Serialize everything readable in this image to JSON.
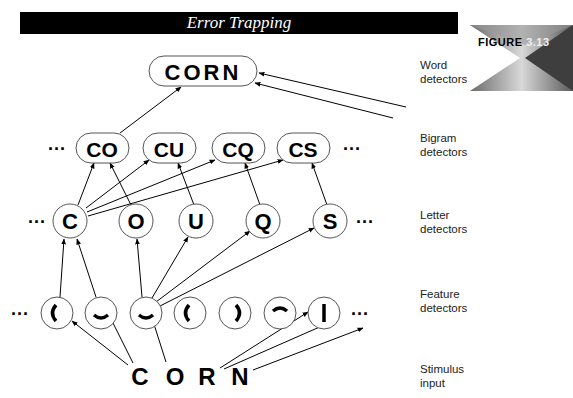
{
  "title": "Error Trapping",
  "figure_badge": {
    "label": "FIGURE",
    "number": "3.13"
  },
  "levels": [
    {
      "key": "word",
      "label_line1": "Word",
      "label_line2": "detectors",
      "nodes": [
        "CORN"
      ]
    },
    {
      "key": "bigram",
      "label_line1": "Bigram",
      "label_line2": "detectors",
      "nodes": [
        "CO",
        "CU",
        "CQ",
        "CS"
      ],
      "ellipsis_left": "···",
      "ellipsis_right": "···"
    },
    {
      "key": "letter",
      "label_line1": "Letter",
      "label_line2": "detectors",
      "nodes": [
        "C",
        "O",
        "U",
        "Q",
        "S"
      ],
      "ellipsis_left": "···",
      "ellipsis_right": "···"
    },
    {
      "key": "feature",
      "label_line1": "Feature",
      "label_line2": "detectors",
      "nodes": [
        "left-curve",
        "bottom-curve",
        "bottom-curve",
        "left-curve",
        "right-curve",
        "top-curve",
        "vertical-bar"
      ],
      "ellipsis_left": "···",
      "ellipsis_right": "···"
    },
    {
      "key": "stimulus",
      "label_line1": "Stimulus",
      "label_line2": "input",
      "nodes": [
        "C",
        "O",
        "R",
        "N"
      ]
    }
  ],
  "colors": {
    "titlebar": "#000000",
    "ink": "#000000",
    "background": "#ffffff"
  }
}
